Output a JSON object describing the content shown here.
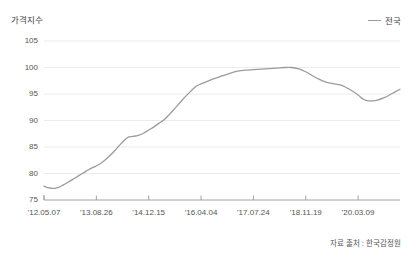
{
  "chart_data": {
    "type": "line",
    "title": "",
    "ylabel": "가격지수",
    "xlabel": "",
    "ylim": [
      75,
      105
    ],
    "yticks": [
      75,
      80,
      85,
      90,
      95,
      100,
      105
    ],
    "grid": true,
    "legend_position": "top-right",
    "source_note": "자료 출처 : 한국감정원",
    "xticks": [
      "'12.05.07",
      "'13.08.26",
      "'14.12.15",
      "'16.04.04",
      "'17.07.24",
      "'18.11.19",
      "'20.03.09"
    ],
    "x_tick_positions": [
      0,
      1,
      2,
      3,
      4,
      5,
      6
    ],
    "series": [
      {
        "name": "전국",
        "color": "#9b9b9b",
        "x": [
          0.0,
          0.05,
          0.1,
          0.15,
          0.2,
          0.28,
          0.36,
          0.45,
          0.55,
          0.65,
          0.75,
          0.85,
          0.95,
          1.05,
          1.15,
          1.25,
          1.35,
          1.45,
          1.55,
          1.62,
          1.7,
          1.8,
          1.9,
          2.0,
          2.1,
          2.2,
          2.3,
          2.4,
          2.5,
          2.6,
          2.7,
          2.8,
          2.9,
          3.0,
          3.12,
          3.25,
          3.4,
          3.55,
          3.7,
          3.85,
          4.0,
          4.15,
          4.3,
          4.45,
          4.6,
          4.72,
          4.85,
          5.0,
          5.12,
          5.25,
          5.4,
          5.55,
          5.7,
          5.85,
          6.0,
          6.1,
          6.2
        ],
        "y": [
          77.6,
          77.4,
          77.3,
          77.2,
          77.2,
          77.4,
          77.8,
          78.3,
          78.9,
          79.5,
          80.1,
          80.7,
          81.2,
          81.7,
          82.4,
          83.3,
          84.3,
          85.4,
          86.4,
          86.9,
          87.0,
          87.2,
          87.6,
          88.2,
          88.8,
          89.5,
          90.2,
          91.2,
          92.3,
          93.4,
          94.5,
          95.5,
          96.4,
          96.9,
          97.4,
          97.9,
          98.4,
          98.9,
          99.3,
          99.5,
          99.6,
          99.7,
          99.8,
          99.9,
          100.0,
          100.0,
          99.8,
          99.2,
          98.5,
          97.8,
          97.2,
          96.9,
          96.6,
          95.8,
          94.8,
          94.0,
          93.7
        ],
        "y_tail_x": [
          6.2,
          6.35,
          6.5,
          6.65,
          6.8
        ],
        "y_tail": [
          93.7,
          93.8,
          94.3,
          95.1,
          95.9
        ]
      }
    ]
  },
  "axis": {
    "y_title": "가격지수"
  },
  "legend": {
    "items": [
      {
        "label": "전국",
        "color": "#9b9b9b"
      }
    ]
  },
  "footer": {
    "source": "자료 출처 : 한국감정원"
  }
}
